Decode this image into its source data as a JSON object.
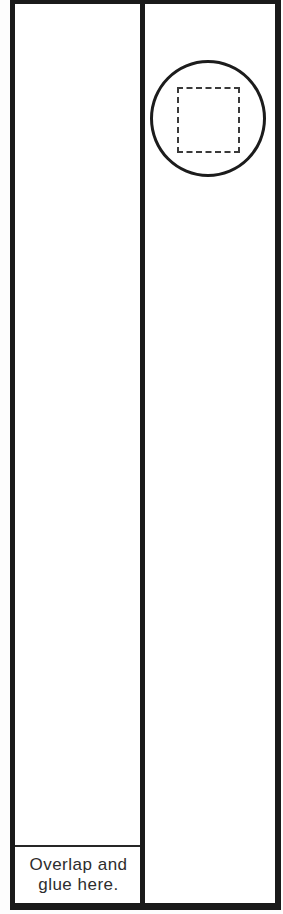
{
  "colors": {
    "ink": "#1a1a1a",
    "paper": "#ffffff",
    "text": "#2d2d2d"
  },
  "left_strip": {
    "glue_area": {
      "line1": "Overlap and",
      "line2": "glue here."
    }
  },
  "right_strip": {
    "circle_shape": "circle-outline",
    "square_shape": "dashed-square"
  }
}
